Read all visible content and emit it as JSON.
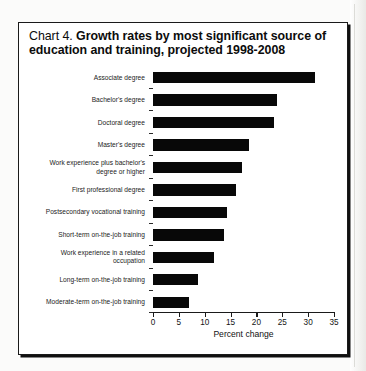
{
  "title": {
    "prefix": "Chart 4.",
    "main": "Growth rates by most significant source of education and training, projected 1998-2008"
  },
  "chart_data": {
    "type": "bar",
    "orientation": "horizontal",
    "title": "Chart 4. Growth rates by most significant source of education and training, projected 1998-2008",
    "xlabel": "Percent change",
    "ylabel": "",
    "xlim": [
      0,
      35
    ],
    "xticks": [
      0,
      5,
      10,
      15,
      20,
      25,
      30,
      35
    ],
    "grid": false,
    "legend": false,
    "bar_color": "#080808",
    "categories": [
      "Associate degree",
      "Bachelor's degree",
      "Doctoral degree",
      "Master's degree",
      "Work experience plus bachelor's degree or higher",
      "First professional degree",
      "Postsecondary vocational training",
      "Short-term on-the-job training",
      "Work experience in a related occupation",
      "Long-term on-the-job training",
      "Moderate-term on-the-job training"
    ],
    "category_lines": [
      [
        "Associate degree"
      ],
      [
        "Bachelor's degree"
      ],
      [
        "Doctoral degree"
      ],
      [
        "Master's degree"
      ],
      [
        "Work experience plus bachelor's",
        "degree or higher"
      ],
      [
        "First professional degree"
      ],
      [
        "Postsecondary vocational training"
      ],
      [
        "Short-term on-the-job training"
      ],
      [
        "Work experience in a related",
        "occupation"
      ],
      [
        "Long-term on-the-job training"
      ],
      [
        "Moderate-term on-the-job training"
      ]
    ],
    "values": [
      31.3,
      24.0,
      23.4,
      18.5,
      17.3,
      16.0,
      14.4,
      13.8,
      11.7,
      8.7,
      6.9
    ]
  }
}
